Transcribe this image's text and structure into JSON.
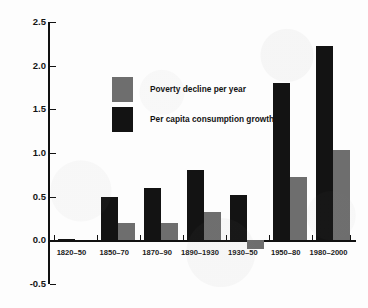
{
  "chart_data": {
    "type": "bar",
    "title": "",
    "subtitle": "",
    "xlabel": "",
    "ylabel": "",
    "categories": [
      "1820–50",
      "1850–70",
      "1870–90",
      "1890–1930",
      "1930–50",
      "1950–80",
      "1980–2000"
    ],
    "series": [
      {
        "name": "Per capita consumption growth",
        "color": "#131313",
        "values": [
          0.02,
          0.5,
          0.6,
          0.8,
          0.52,
          1.8,
          2.22
        ]
      },
      {
        "name": "Poverty decline per year",
        "color": "#6e6e6e",
        "values": [
          0.0,
          0.2,
          0.2,
          0.32,
          -0.1,
          0.72,
          1.03
        ]
      }
    ],
    "ylim": [
      -0.5,
      2.5
    ],
    "yticks": [
      -0.5,
      0.0,
      0.5,
      1.0,
      1.5,
      2.0,
      2.5
    ],
    "ytick_labels": [
      "-0.5",
      "0.0",
      "0.5",
      "1.0",
      "1.5",
      "2.0",
      "2.5"
    ],
    "grid": false,
    "legend_position": "upper-left-inside",
    "legend": [
      {
        "label": "Poverty decline per year",
        "color": "#6e6e6e"
      },
      {
        "label": "Per capita consumption growth",
        "color": "#131313"
      }
    ]
  }
}
